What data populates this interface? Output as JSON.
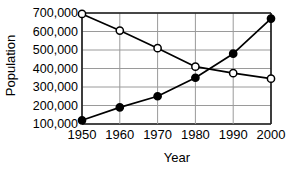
{
  "chart_data": {
    "type": "line",
    "title": "",
    "xlabel": "Year",
    "ylabel": "Population",
    "categories": [
      "1950",
      "1960",
      "1970",
      "1980",
      "1990",
      "2000"
    ],
    "x": [
      1950,
      1960,
      1970,
      1980,
      1990,
      2000
    ],
    "xlim": [
      1950,
      2000
    ],
    "ylim": [
      100000,
      700000
    ],
    "grid": true,
    "legend": "none",
    "y_tick_labels": [
      "700,000",
      "600,000",
      "500,000",
      "400,000",
      "300,000",
      "200,000",
      "100,000"
    ],
    "y_tick_values": [
      700000,
      600000,
      500000,
      400000,
      300000,
      200000,
      100000
    ],
    "x_tick_labels": [
      "1950",
      "1960",
      "1970",
      "1980",
      "1990",
      "2000"
    ],
    "series": [
      {
        "name": "declining-population",
        "marker": "open-circle",
        "values": [
          695000,
          605000,
          510000,
          410000,
          375000,
          345000
        ]
      },
      {
        "name": "rising-population",
        "marker": "filled-circle",
        "values": [
          120000,
          190000,
          250000,
          350000,
          480000,
          670000
        ]
      }
    ]
  },
  "colors": {
    "line": "#000000",
    "marker_fill_open": "#ffffff",
    "marker_fill_closed": "#000000",
    "grid": "#9a9a9a",
    "axis": "#1a1a1a",
    "background": "#ffffff"
  }
}
